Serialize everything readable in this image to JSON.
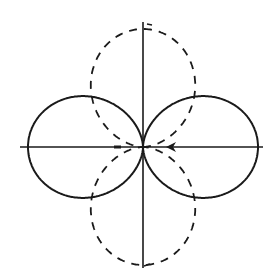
{
  "diagram": {
    "origin": [
      143,
      147
    ],
    "axes": {
      "horizontal": {
        "x1": 20,
        "x2": 263,
        "y": 147
      },
      "vertical": {
        "x": 143,
        "y1": 22,
        "y2": 268
      }
    },
    "solid_pattern": {
      "style": "solid",
      "orientation": "horizontal",
      "extent_px": 115,
      "formula": "r = A*|cos(theta)|^1.4",
      "color": "#1a1a1a"
    },
    "dashed_pattern": {
      "style": "dashed",
      "orientation": "vertical",
      "extent_px": 118,
      "formula": "r = A*|sin(theta)|^1.4",
      "color": "#1a1a1a"
    },
    "arrows": [
      {
        "x": 174,
        "y": 147,
        "direction": "left"
      }
    ],
    "colors": {
      "stroke": "#1a1a1a",
      "background": "#ffffff"
    }
  }
}
